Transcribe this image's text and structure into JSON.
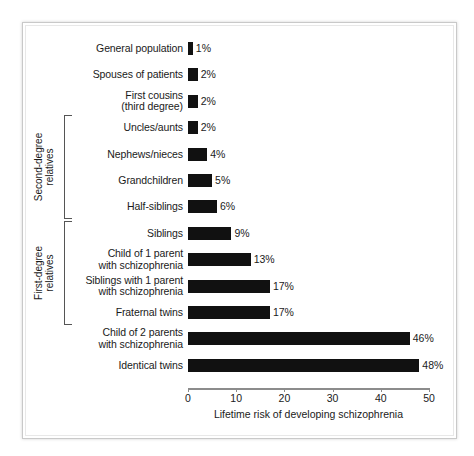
{
  "chart_data": {
    "type": "bar",
    "orientation": "horizontal",
    "title": "",
    "xlabel": "Lifetime risk of developing schizophrenia",
    "ylabel": "",
    "xlim": [
      0,
      50
    ],
    "xticks": [
      0,
      10,
      20,
      30,
      40,
      50
    ],
    "grid": false,
    "legend": null,
    "bar_color": "#111111",
    "value_suffix": "%",
    "categories": [
      "General population",
      "Spouses of patients",
      "First cousins (third degree)",
      "Uncles/aunts",
      "Nephews/nieces",
      "Grandchildren",
      "Half-siblings",
      "Siblings",
      "Child of 1 parent with schizophrenia",
      "Siblings with 1 parent with schizophrenia",
      "Fraternal twins",
      "Child of 2 parents with schizophrenia",
      "Identical twins"
    ],
    "values": [
      1,
      2,
      2,
      2,
      4,
      5,
      6,
      9,
      13,
      17,
      17,
      46,
      48
    ],
    "value_labels": [
      "1%",
      "2%",
      "2%",
      "2%",
      "4%",
      "5%",
      "6%",
      "9%",
      "13%",
      "17%",
      "17%",
      "46%",
      "48%"
    ],
    "groups": [
      {
        "name": "Second-degree relatives",
        "from": 3,
        "to": 6
      },
      {
        "name": "First-degree relatives",
        "from": 7,
        "to": 10
      }
    ]
  },
  "rows": [
    {
      "line1": "General population",
      "line2": "",
      "value_label": "1%"
    },
    {
      "line1": "Spouses of patients",
      "line2": "",
      "value_label": "2%"
    },
    {
      "line1": "First cousins",
      "line2": "(third degree)",
      "value_label": "2%"
    },
    {
      "line1": "Uncles/aunts",
      "line2": "",
      "value_label": "2%"
    },
    {
      "line1": "Nephews/nieces",
      "line2": "",
      "value_label": "4%"
    },
    {
      "line1": "Grandchildren",
      "line2": "",
      "value_label": "5%"
    },
    {
      "line1": "Half-siblings",
      "line2": "",
      "value_label": "6%"
    },
    {
      "line1": "Siblings",
      "line2": "",
      "value_label": "9%"
    },
    {
      "line1": "Child of 1 parent",
      "line2": "with schizophrenia",
      "value_label": "13%"
    },
    {
      "line1": "Siblings with 1 parent",
      "line2": "with schizophrenia",
      "value_label": "17%"
    },
    {
      "line1": "Fraternal twins",
      "line2": "",
      "value_label": "17%"
    },
    {
      "line1": "Child of 2 parents",
      "line2": "with schizophrenia",
      "value_label": "46%"
    },
    {
      "line1": "Identical twins",
      "line2": "",
      "value_label": "48%"
    }
  ],
  "axis": {
    "title": "Lifetime risk of developing schizophrenia",
    "tick_labels": [
      "0",
      "10",
      "20",
      "30",
      "40",
      "50"
    ]
  },
  "groups": {
    "second_degree": {
      "line1": "Second-degree",
      "line2": "relatives"
    },
    "first_degree": {
      "line1": "First-degree",
      "line2": "relatives"
    }
  }
}
